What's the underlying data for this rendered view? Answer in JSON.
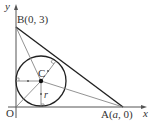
{
  "diagram": {
    "type": "geometry",
    "axes": {
      "x_label": "x",
      "y_label": "y",
      "origin_label": "O"
    },
    "points": {
      "B": {
        "label": "B(0, 3)"
      },
      "A": {
        "label_prefix": "A(",
        "label_var": "a",
        "label_suffix": ", 0)"
      },
      "C": {
        "label": "C"
      }
    },
    "radius_label": "r",
    "colors": {
      "line": "#333333",
      "thin_line": "#666666",
      "background": "#ffffff"
    }
  }
}
